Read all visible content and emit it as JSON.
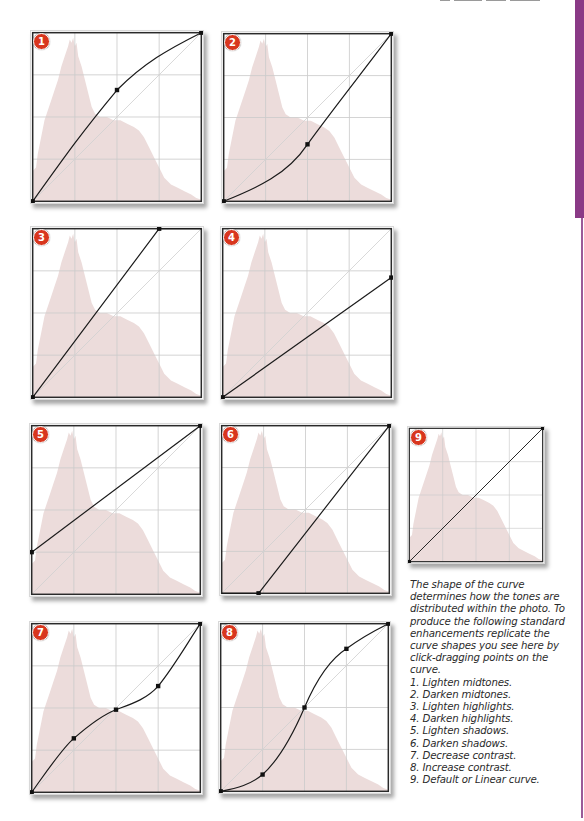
{
  "page": {
    "side_tab_color": "#8a3a86",
    "badge_color": "#d8361e",
    "histogram_color": "#ecdcdb",
    "grid_color": "#cccccc",
    "curve_color": "#1a1a1a"
  },
  "histogram_path": "M0,100 L0,82 L2,80 L3,72 L5,62 L7,52 L9,46 L11,40 L13,34 L15,28 L17,20 L19,14 L21,8 L22,4 L23,6 L24,3 L25,8 L26,6 L27,14 L29,20 L31,28 L33,36 L35,44 L37,48 L40,50 L44,50 L48,52 L52,52 L56,54 L60,56 L63,58 L66,62 L69,68 L72,74 L75,80 L78,86 L82,90 L86,92 L90,94 L94,96 L97,98 L100,99 L100,100 Z",
  "panels": [
    {
      "id": "1",
      "label": "1",
      "caption": "Lighten midtones",
      "box": {
        "left": 30,
        "top": 30,
        "size": 172
      },
      "curve": "M0,100 C20,72 30,58 50,34 C66,18 80,10 100,0",
      "points": [
        [
          0,
          100
        ],
        [
          50,
          34
        ],
        [
          100,
          0
        ]
      ]
    },
    {
      "id": "2",
      "label": "2",
      "caption": "Darken midtones",
      "box": {
        "left": 221,
        "top": 31,
        "size": 171
      },
      "curve": "M0,100 C20,92 38,84 50,66 C66,44 82,24 100,0",
      "points": [
        [
          0,
          100
        ],
        [
          50,
          66
        ],
        [
          100,
          0
        ]
      ]
    },
    {
      "id": "3",
      "label": "3",
      "caption": "Lighten highlights",
      "box": {
        "left": 30,
        "top": 226,
        "size": 172
      },
      "curve": "M0,100 L75,0 L100,0",
      "points": [
        [
          0,
          100
        ],
        [
          75,
          0
        ]
      ]
    },
    {
      "id": "4",
      "label": "4",
      "caption": "Darken highlights",
      "box": {
        "left": 220,
        "top": 226,
        "size": 172
      },
      "curve": "M0,100 L100,29",
      "points": [
        [
          0,
          100
        ],
        [
          100,
          29
        ]
      ]
    },
    {
      "id": "5",
      "label": "5",
      "caption": "Lighten shadows",
      "box": {
        "left": 29,
        "top": 423,
        "size": 172
      },
      "curve": "M0,75 L100,0",
      "points": [
        [
          0,
          75
        ],
        [
          100,
          0
        ]
      ]
    },
    {
      "id": "6",
      "label": "6",
      "caption": "Darken shadows",
      "box": {
        "left": 219,
        "top": 423,
        "size": 171
      },
      "curve": "M0,100 L22,100 L100,0",
      "points": [
        [
          22,
          100
        ],
        [
          100,
          0
        ]
      ]
    },
    {
      "id": "7",
      "label": "7",
      "caption": "Decrease contrast",
      "box": {
        "left": 29,
        "top": 621,
        "size": 172
      },
      "curve": "M0,100 C10,86 18,74 25,68 C33,61 42,54 50,51 C58,48 68,45 75,37 C84,26 92,12 100,0",
      "points": [
        [
          0,
          100
        ],
        [
          25,
          68
        ],
        [
          50,
          51
        ],
        [
          75,
          37
        ],
        [
          100,
          0
        ]
      ]
    },
    {
      "id": "8",
      "label": "8",
      "caption": "Increase contrast",
      "box": {
        "left": 218,
        "top": 621,
        "size": 171
      },
      "curve": "M0,100 C10,98 18,96 25,90 C36,80 44,64 50,50 C56,36 64,22 75,15 C84,8 92,4 100,0",
      "points": [
        [
          0,
          100
        ],
        [
          25,
          90
        ],
        [
          50,
          50
        ],
        [
          75,
          15
        ],
        [
          100,
          0
        ]
      ]
    },
    {
      "id": "9",
      "label": "9",
      "caption": "Default or Linear curve",
      "box": {
        "left": 407,
        "top": 426,
        "size": 136
      },
      "curve": "M0,100 L100,0",
      "points": [
        [
          0,
          100
        ],
        [
          100,
          0
        ]
      ]
    }
  ],
  "caption": {
    "intro": "The shape of the curve determines how the tones are distributed within the photo. To produce the following standard enhancements replicate the curve shapes you see here by click-dragging points on the curve.",
    "items": [
      "1. Lighten midtones.",
      "2. Darken midtones.",
      "3. Lighten highlights.",
      "4. Darken highlights.",
      "5. Lighten shadows.",
      "6. Darken shadows.",
      "7. Decrease contrast.",
      "8. Increase contrast.",
      "9. Default or Linear curve."
    ]
  }
}
